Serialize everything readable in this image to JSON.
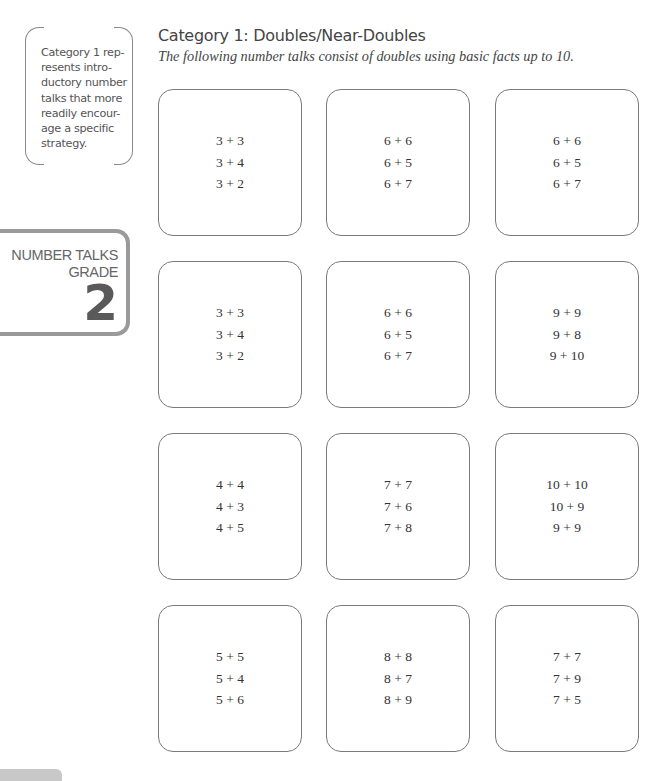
{
  "sidebar": {
    "note": "Category 1 rep-resents intro-ductory number talks that more readily encour-age a specific strategy.",
    "note_lines": [
      "Category 1 rep-",
      "resents intro-",
      "ductory number",
      "talks that more",
      "readily encour-",
      "age a specific",
      "strategy."
    ],
    "badge": {
      "line1": "NUMBER TALKS",
      "line2": "GRADE",
      "grade": "2"
    }
  },
  "header": {
    "title": "Category 1: Doubles/Near-Doubles",
    "subtitle": "The following number talks consist of doubles using basic facts up to 10."
  },
  "cards": [
    {
      "lines": [
        "3 + 3",
        "3 + 4",
        "3 + 2"
      ]
    },
    {
      "lines": [
        "6 + 6",
        "6 + 5",
        "6 + 7"
      ]
    },
    {
      "lines": [
        "6 + 6",
        "6 + 5",
        "6 + 7"
      ]
    },
    {
      "lines": [
        "3 + 3",
        "3 + 4",
        "3 + 2"
      ]
    },
    {
      "lines": [
        "6 + 6",
        "6 + 5",
        "6 + 7"
      ]
    },
    {
      "lines": [
        "9 + 9",
        "9 + 8",
        "9 + 10"
      ]
    },
    {
      "lines": [
        "4 + 4",
        "4 + 3",
        "4 + 5"
      ]
    },
    {
      "lines": [
        "7 + 7",
        "7 + 6",
        "7 + 8"
      ]
    },
    {
      "lines": [
        "10 + 10",
        "10 + 9",
        "9 + 9"
      ]
    },
    {
      "lines": [
        "5 + 5",
        "5 + 4",
        "5 + 6"
      ]
    },
    {
      "lines": [
        "8 + 8",
        "8 + 7",
        "8 + 9"
      ]
    },
    {
      "lines": [
        "7 + 7",
        "7 + 9",
        "7 + 5"
      ]
    }
  ]
}
